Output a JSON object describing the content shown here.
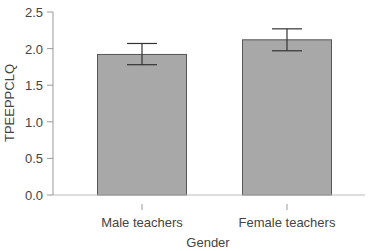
{
  "chart_data": {
    "type": "bar",
    "title": "",
    "xlabel": "Gender",
    "ylabel": "TPEEPPCLQ",
    "categories": [
      "Male teachers",
      "Female teachers"
    ],
    "values": [
      1.92,
      2.12
    ],
    "error_bars": [
      {
        "low": 1.78,
        "high": 2.07
      },
      {
        "low": 1.97,
        "high": 2.27
      }
    ],
    "ylim": [
      0,
      2.5
    ],
    "yticks": [
      "0.0",
      "0.5",
      "1.0",
      "1.5",
      "2.0",
      "2.5"
    ],
    "grid": false,
    "legend": null,
    "bar_color": "#a8a8a8",
    "bar_edge_color": "#555555"
  }
}
